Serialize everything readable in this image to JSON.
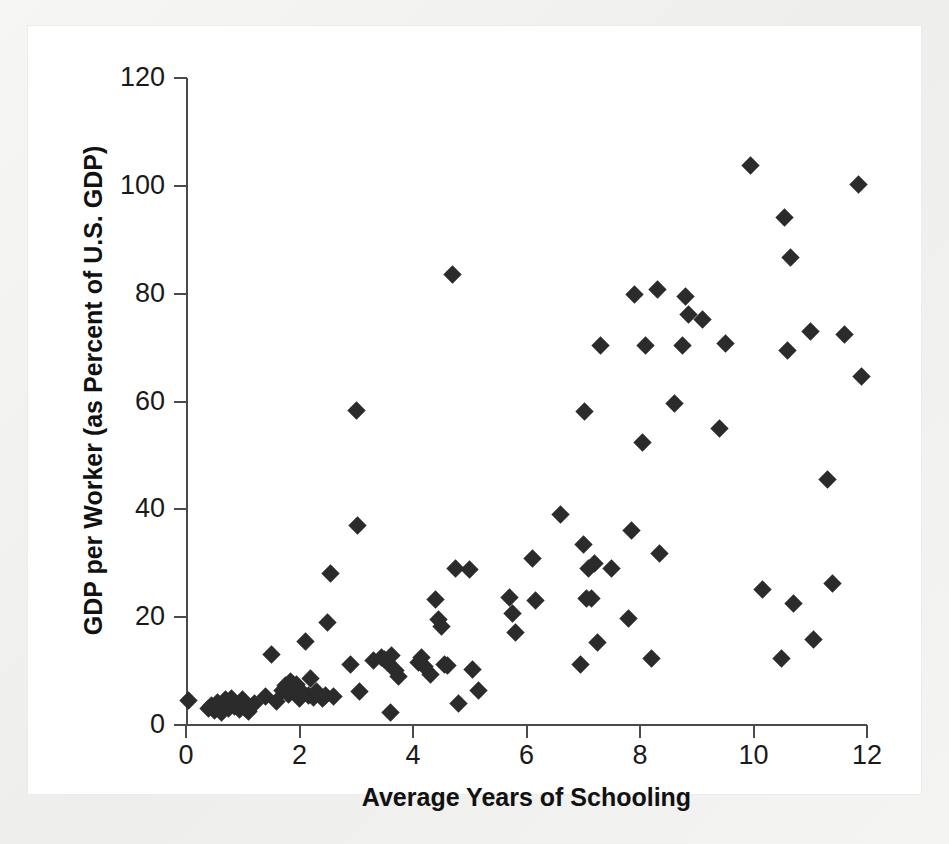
{
  "figure": {
    "background_color": "#f2f2f0",
    "plate_color": "#ffffff",
    "marker_color": "#2b2b2b",
    "axis_color": "#4a4a4a"
  },
  "chart_data": {
    "type": "scatter",
    "title": "",
    "xlabel": "Average Years of Schooling",
    "ylabel": "GDP per Worker (as Percent of U.S. GDP)",
    "xlim": [
      0,
      12
    ],
    "ylim": [
      0,
      120
    ],
    "xticks": [
      0,
      2,
      4,
      6,
      8,
      10,
      12
    ],
    "yticks": [
      0,
      20,
      40,
      60,
      80,
      100,
      120
    ],
    "xtick_labels": [
      "0",
      "2",
      "4",
      "6",
      "8",
      "10",
      "12"
    ],
    "ytick_labels": [
      "0",
      "20",
      "40",
      "60",
      "80",
      "100",
      "120"
    ],
    "grid": false,
    "legend": null,
    "marker": "diamond",
    "n_points": 103,
    "points": [
      [
        0.05,
        4.6
      ],
      [
        0.4,
        3.0
      ],
      [
        0.45,
        3.6
      ],
      [
        0.5,
        2.6
      ],
      [
        0.55,
        4.2
      ],
      [
        0.6,
        3.3
      ],
      [
        0.62,
        2.4
      ],
      [
        0.7,
        4.7
      ],
      [
        0.75,
        3.0
      ],
      [
        0.8,
        4.9
      ],
      [
        0.85,
        3.4
      ],
      [
        0.95,
        2.8
      ],
      [
        1.0,
        4.8
      ],
      [
        1.05,
        3.1
      ],
      [
        1.1,
        2.5
      ],
      [
        1.2,
        3.9
      ],
      [
        1.4,
        5.2
      ],
      [
        1.5,
        13.1
      ],
      [
        1.6,
        4.3
      ],
      [
        1.7,
        6.4
      ],
      [
        1.75,
        7.3
      ],
      [
        1.8,
        5.6
      ],
      [
        1.85,
        8.0
      ],
      [
        1.9,
        6.8
      ],
      [
        1.95,
        7.6
      ],
      [
        2.0,
        5.0
      ],
      [
        2.05,
        6.0
      ],
      [
        2.1,
        15.4
      ],
      [
        2.15,
        5.4
      ],
      [
        2.2,
        8.6
      ],
      [
        2.25,
        5.1
      ],
      [
        2.3,
        6.2
      ],
      [
        2.4,
        4.9
      ],
      [
        2.45,
        5.5
      ],
      [
        2.5,
        19.1
      ],
      [
        2.55,
        28.1
      ],
      [
        2.6,
        5.3
      ],
      [
        2.9,
        11.3
      ],
      [
        3.0,
        58.3
      ],
      [
        3.02,
        37.0
      ],
      [
        3.05,
        6.2
      ],
      [
        3.3,
        11.9
      ],
      [
        3.45,
        12.6
      ],
      [
        3.5,
        12.1
      ],
      [
        3.55,
        11.5
      ],
      [
        3.6,
        2.3
      ],
      [
        3.62,
        12.9
      ],
      [
        3.7,
        10.2
      ],
      [
        3.75,
        9.0
      ],
      [
        4.1,
        11.6
      ],
      [
        4.15,
        12.5
      ],
      [
        4.2,
        10.8
      ],
      [
        4.3,
        9.4
      ],
      [
        4.4,
        23.3
      ],
      [
        4.45,
        19.6
      ],
      [
        4.5,
        18.2
      ],
      [
        4.55,
        11.2
      ],
      [
        4.6,
        11.0
      ],
      [
        4.7,
        83.5
      ],
      [
        4.75,
        29.1
      ],
      [
        4.8,
        3.9
      ],
      [
        5.0,
        28.9
      ],
      [
        5.05,
        10.3
      ],
      [
        5.15,
        6.4
      ],
      [
        5.7,
        23.6
      ],
      [
        5.75,
        20.7
      ],
      [
        5.8,
        17.1
      ],
      [
        6.1,
        30.8
      ],
      [
        6.15,
        23.1
      ],
      [
        6.6,
        39.0
      ],
      [
        6.95,
        11.2
      ],
      [
        7.0,
        33.4
      ],
      [
        7.02,
        58.2
      ],
      [
        7.05,
        23.5
      ],
      [
        7.1,
        29.0
      ],
      [
        7.15,
        23.4
      ],
      [
        7.2,
        30.0
      ],
      [
        7.25,
        15.3
      ],
      [
        7.3,
        70.4
      ],
      [
        7.5,
        29.1
      ],
      [
        7.8,
        19.7
      ],
      [
        7.85,
        36.0
      ],
      [
        7.9,
        79.9
      ],
      [
        8.05,
        52.4
      ],
      [
        8.1,
        70.4
      ],
      [
        8.2,
        12.4
      ],
      [
        8.3,
        80.7
      ],
      [
        8.35,
        31.8
      ],
      [
        8.6,
        59.6
      ],
      [
        8.75,
        70.4
      ],
      [
        8.8,
        79.5
      ],
      [
        8.85,
        76.2
      ],
      [
        9.1,
        75.2
      ],
      [
        9.4,
        54.9
      ],
      [
        9.5,
        70.7
      ],
      [
        9.95,
        103.7
      ],
      [
        10.15,
        25.2
      ],
      [
        10.5,
        12.4
      ],
      [
        10.55,
        94.2
      ],
      [
        10.6,
        69.4
      ],
      [
        10.65,
        86.8
      ],
      [
        10.7,
        22.6
      ],
      [
        11.0,
        73.0
      ],
      [
        11.05,
        15.9
      ],
      [
        11.3,
        45.6
      ],
      [
        11.4,
        26.3
      ],
      [
        11.6,
        72.4
      ],
      [
        11.85,
        100.2
      ],
      [
        11.9,
        64.7
      ]
    ]
  }
}
